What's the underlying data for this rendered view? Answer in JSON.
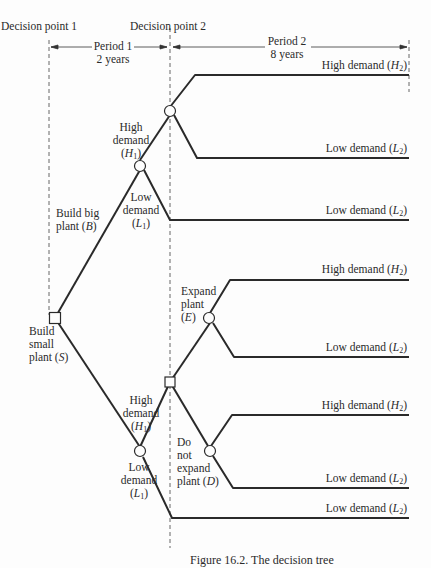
{
  "header": {
    "decision_point_1": "Decision point 1",
    "decision_point_2": "Decision point 2",
    "period_1": {
      "name": "Period 1",
      "duration": "2 years"
    },
    "period_2": {
      "name": "Period 2",
      "duration": "8 years"
    }
  },
  "nodes": {
    "root_decision": {
      "type": "decision",
      "shape": "square"
    },
    "big_plant_chance": {
      "type": "chance",
      "shape": "circle"
    },
    "big_plant_h1_chance": {
      "type": "chance",
      "shape": "circle"
    },
    "small_plant_decision_2": {
      "type": "decision",
      "shape": "square"
    },
    "small_plant_chance": {
      "type": "chance",
      "shape": "circle"
    },
    "expand_chance": {
      "type": "chance",
      "shape": "circle"
    },
    "no_expand_chance": {
      "type": "chance",
      "shape": "circle"
    }
  },
  "labels": {
    "build_big": {
      "line1": "Build big",
      "line2": "plant (",
      "sym": "B",
      "close": ")"
    },
    "build_small": {
      "line1": "Build",
      "line2": "small",
      "line3": "plant (",
      "sym": "S",
      "close": ")"
    },
    "big_high_demand": {
      "line1": "High",
      "line2": "demand",
      "sym": "H",
      "sub": "1"
    },
    "big_low_demand": {
      "line1": "Low",
      "line2": "demand",
      "sym": "L",
      "sub": "1"
    },
    "small_high_demand": {
      "line1": "High",
      "line2": "demand",
      "sym": "H",
      "sub": "1"
    },
    "small_low_demand": {
      "line1": "Low",
      "line2": "demand",
      "sym": "L",
      "sub": "1"
    },
    "expand": {
      "line1": "Expand",
      "line2": "plant",
      "sym": "E"
    },
    "no_expand": {
      "line1": "Do",
      "line2": "not",
      "line3": "expand",
      "line4": "plant (",
      "sym": "D",
      "close": ")"
    }
  },
  "outcomes": [
    {
      "text": "High demand (",
      "sym": "H",
      "sub": "2",
      "close": ")"
    },
    {
      "text": "Low demand (",
      "sym": "L",
      "sub": "2",
      "close": ")"
    },
    {
      "text": "Low demand (",
      "sym": "L",
      "sub": "2",
      "close": ")"
    },
    {
      "text": "High demand (",
      "sym": "H",
      "sub": "2",
      "close": ")"
    },
    {
      "text": "Low demand (",
      "sym": "L",
      "sub": "2",
      "close": ")"
    },
    {
      "text": "High demand (",
      "sym": "H",
      "sub": "2",
      "close": ")"
    },
    {
      "text": "Low demand (",
      "sym": "L",
      "sub": "2",
      "close": ")"
    },
    {
      "text": "Low demand (",
      "sym": "L",
      "sub": "2",
      "close": ")"
    }
  ],
  "caption": "Figure 16.2. The decision tree",
  "colors": {
    "line": "#2a2a2a",
    "background": "#fdfdfd"
  }
}
